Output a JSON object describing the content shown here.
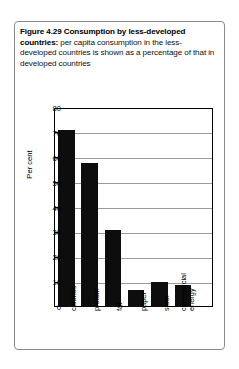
{
  "figure": {
    "caption_bold": "Figure 4.29  Consumption by less-developed countries:",
    "caption_rest": " per capita consumption in the less-developed countries is shown as a percentage of that in developed countries"
  },
  "chart_data": {
    "type": "bar",
    "title": "Figure 4.29 Consumption by less-developed countries",
    "categories": [
      "calories",
      "protein",
      "fat",
      "paper",
      "steel",
      "commercial energy"
    ],
    "category_lines": [
      [
        "calories"
      ],
      [
        "protein"
      ],
      [
        "fat"
      ],
      [
        "paper"
      ],
      [
        "steel"
      ],
      [
        "commercial",
        "energy"
      ]
    ],
    "values": [
      71,
      58,
      31,
      7,
      10,
      9
    ],
    "xlabel": "",
    "ylabel": "Per cent",
    "ylim": [
      0,
      80
    ],
    "ytick_step": 10,
    "yticks": [
      0,
      10,
      20,
      30,
      40,
      50,
      60,
      70,
      80
    ],
    "ytick_labels": [
      "0",
      "10",
      "20",
      "30",
      "40",
      "50",
      "60",
      "70",
      "80"
    ],
    "grid": true,
    "legend": false,
    "bar_color": "#0d0d0d",
    "grid_color": "#9b9b9b",
    "frame_color": "#000000"
  }
}
